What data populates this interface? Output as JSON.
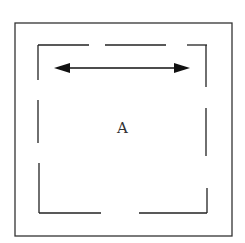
{
  "diagram": {
    "label": "A",
    "line_color": "#222222",
    "arrow": "double-headed horizontal arrow"
  }
}
